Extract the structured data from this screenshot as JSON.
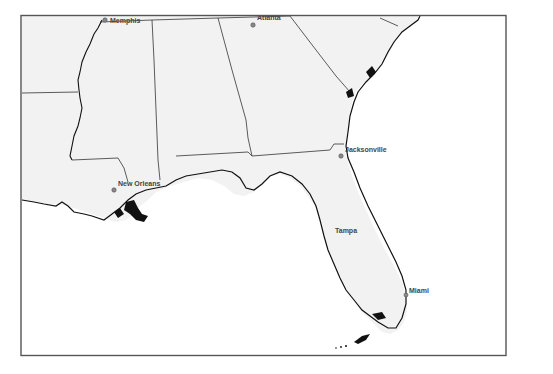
{
  "map": {
    "title": "",
    "region": "Southeastern United States",
    "colors": {
      "land": "#f2f2f2",
      "water": "#ffffff",
      "frame": "#555555",
      "border": "#333333",
      "coast": "#111111",
      "city_dot": "#888888",
      "label": "#444444"
    },
    "cities": [
      {
        "name": "Memphis",
        "x": 105,
        "y": 20,
        "label_dx": 5,
        "label_dy": 2
      },
      {
        "name": "Atlanta",
        "x": 253,
        "y": 24,
        "label_dx": 4,
        "label_dy": -4
      },
      {
        "name": "Jacksonville",
        "x": 341,
        "y": 156,
        "label_dx": 4,
        "label_dy": -4
      },
      {
        "name": "New Orleans",
        "x": 114,
        "y": 190,
        "label_dx": 4,
        "label_dy": -4
      },
      {
        "name": "Tampa",
        "x": 335,
        "y": 230,
        "label_dx": 0,
        "label_dy": 0
      },
      {
        "name": "Miami",
        "x": 407,
        "y": 295,
        "label_dx": 3,
        "label_dy": -3
      }
    ]
  }
}
